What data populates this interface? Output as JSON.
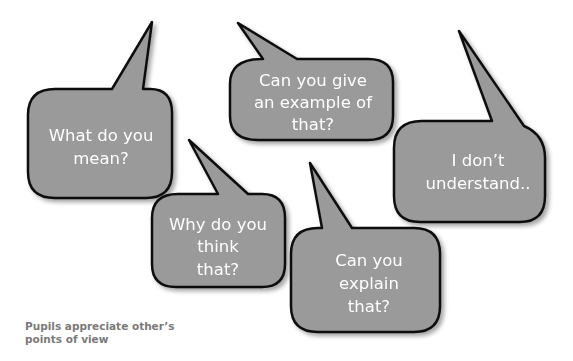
{
  "colors": {
    "bubble_fill": "#9a9a9a",
    "bubble_stroke": "#111111",
    "bubble_text": "#ffffff",
    "caption_text": "#7a7a7a",
    "background": "#ffffff"
  },
  "bubbles": [
    {
      "id": "what-do-you-mean",
      "lines": [
        "What do you",
        "mean?"
      ]
    },
    {
      "id": "give-example",
      "lines": [
        "Can you give",
        "an example of",
        "that?"
      ]
    },
    {
      "id": "dont-understand",
      "lines": [
        "I don’t",
        "understand.."
      ]
    },
    {
      "id": "why-think",
      "lines": [
        "Why do you",
        "think",
        "that?"
      ]
    },
    {
      "id": "explain-that",
      "lines": [
        "Can you",
        "explain",
        "that?"
      ]
    }
  ],
  "caption": {
    "lines": [
      "Pupils appreciate other’s",
      "points of view"
    ]
  }
}
